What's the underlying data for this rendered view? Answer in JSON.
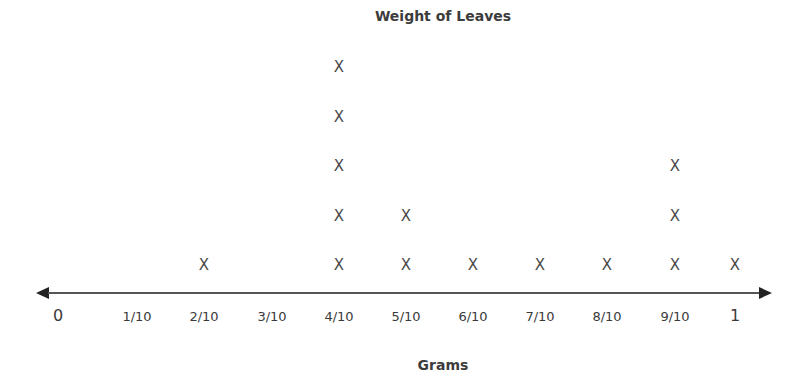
{
  "chart_data": {
    "type": "dot_plot",
    "title": "Weight of Leaves",
    "xlabel": "Grams",
    "ylabel": "",
    "marker": "X",
    "categories": [
      "0",
      "1/10",
      "2/10",
      "3/10",
      "4/10",
      "5/10",
      "6/10",
      "7/10",
      "8/10",
      "9/10",
      "1"
    ],
    "values": [
      0,
      0,
      1,
      0,
      5,
      2,
      1,
      1,
      1,
      3,
      1
    ],
    "axis": {
      "arrows": "both",
      "grid": false
    },
    "tick_x_px": [
      58,
      137,
      204,
      272,
      339,
      406,
      473,
      540,
      607,
      675,
      735
    ],
    "colors": {
      "axis": "#555555",
      "marker": "#4a4a4a",
      "text": "#3a3a3a"
    }
  }
}
